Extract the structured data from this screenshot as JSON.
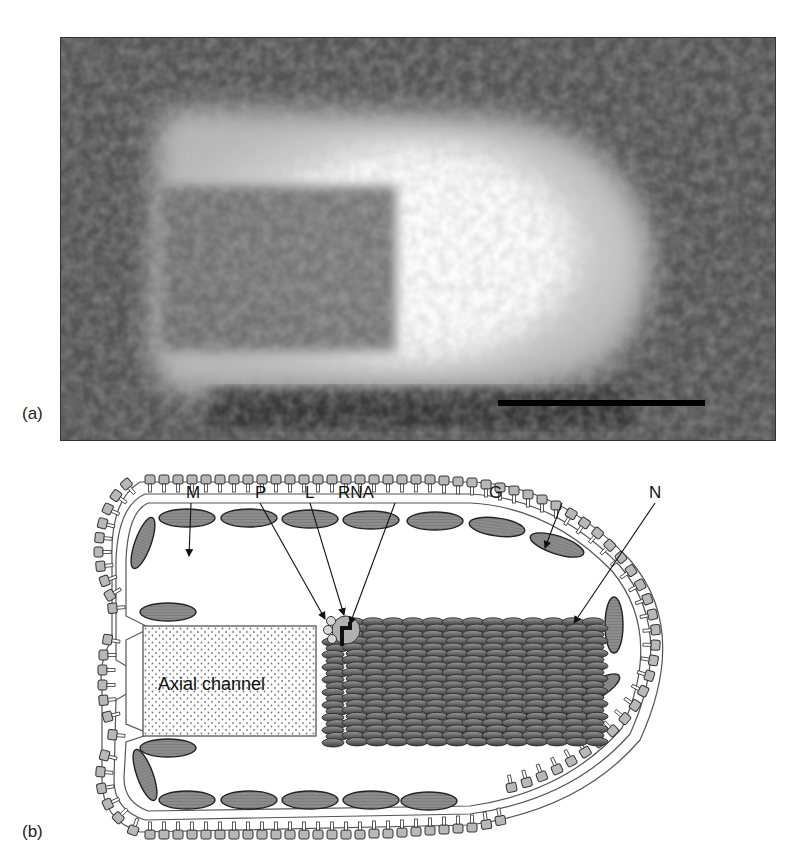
{
  "figure": {
    "panel_a": {
      "label": "(a)",
      "description": "Electron micrograph of a bullet-shaped virion",
      "scale_bar": true
    },
    "panel_b": {
      "label": "(b)",
      "description": "Schematic of bullet-shaped virion structure",
      "labels": {
        "M": "M",
        "P": "P",
        "L": "L",
        "RNA": "RNA",
        "G": "G",
        "N": "N",
        "axial_channel": "Axial channel"
      }
    }
  },
  "colors": {
    "protein_fill": "#8a8a8a",
    "membrane_bead": "#b5b5b5",
    "n_fill": "#6e6e6e",
    "outline": "#222222"
  }
}
